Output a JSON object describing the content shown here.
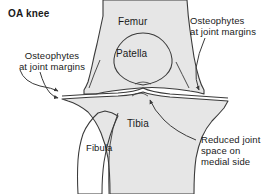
{
  "figure": {
    "title": "OA knee",
    "width": 276,
    "height": 194,
    "background_color": "#ffffff",
    "line_color": "#3a3a3a",
    "bone_fill_color": "#e6e6e6",
    "text_color": "#1a1a1a"
  },
  "bone_labels": {
    "femur": "Femur",
    "patella": "Patella",
    "tibia": "Tibia",
    "fibula": "Fibula"
  },
  "annotations": {
    "osteophytes_left": "Osteophytes\nat joint margins",
    "osteophytes_right": "Osteophytes\nat joint margins",
    "reduced_joint_space": "Reduced joint\nspace on\nmedial side"
  }
}
